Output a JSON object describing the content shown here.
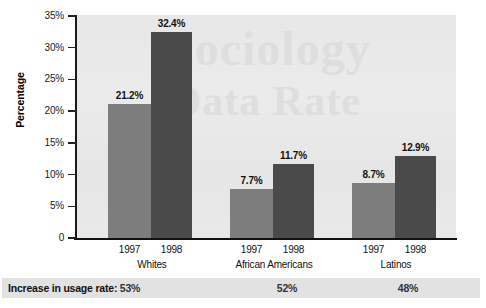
{
  "chart_data": {
    "type": "bar",
    "title": "",
    "xlabel": "",
    "ylabel": "Percentage",
    "ylim": [
      0,
      35
    ],
    "ytick_labels": [
      "0",
      "5%",
      "10%",
      "15%",
      "20%",
      "25%",
      "30%",
      "35%"
    ],
    "ytick_values": [
      0,
      5,
      10,
      15,
      20,
      25,
      30,
      35
    ],
    "grid": false,
    "legend": "none",
    "categories": [
      "Whites",
      "African Americans",
      "Latinos"
    ],
    "series": [
      {
        "name": "1997",
        "values": [
          21.2,
          7.7,
          8.7
        ],
        "labels": [
          "21.2%",
          "7.7%",
          "8.7%"
        ],
        "color": "#7d7d7d"
      },
      {
        "name": "1998",
        "values": [
          32.4,
          11.7,
          12.9
        ],
        "labels": [
          "32.4%",
          "11.7%",
          "12.9%"
        ],
        "color": "#4a4a4a"
      }
    ],
    "annotations": {
      "footer_label": "Increase in usage rate:",
      "footer_values": [
        "53%",
        "52%",
        "48%"
      ]
    },
    "watermark": {
      "line1": "Sociology",
      "line2": "Data Rate"
    }
  },
  "axis": {
    "y_title": "Percentage",
    "ticks": [
      {
        "label": "35%",
        "value": 35
      },
      {
        "label": "30%",
        "value": 30
      },
      {
        "label": "25%",
        "value": 25
      },
      {
        "label": "20%",
        "value": 20
      },
      {
        "label": "15%",
        "value": 15
      },
      {
        "label": "10%",
        "value": 10
      },
      {
        "label": "5%",
        "value": 5
      },
      {
        "label": "0",
        "value": 0
      }
    ]
  },
  "groups": [
    {
      "name": "Whites",
      "bars": [
        {
          "year": "1997",
          "label": "21.2%",
          "value": 21.2
        },
        {
          "year": "1998",
          "label": "32.4%",
          "value": 32.4
        }
      ],
      "increase": "53%"
    },
    {
      "name": "African Americans",
      "bars": [
        {
          "year": "1997",
          "label": "7.7%",
          "value": 7.7
        },
        {
          "year": "1998",
          "label": "11.7%",
          "value": 11.7
        }
      ],
      "increase": "52%"
    },
    {
      "name": "Latinos",
      "bars": [
        {
          "year": "1997",
          "label": "8.7%",
          "value": 8.7
        },
        {
          "year": "1998",
          "label": "12.9%",
          "value": 12.9
        }
      ],
      "increase": "48%"
    }
  ],
  "footer": {
    "label": "Increase in usage rate:",
    "values": [
      "53%",
      "52%",
      "48%"
    ]
  },
  "colors": {
    "bar_1997": "#7d7d7d",
    "bar_1998": "#4a4a4a",
    "plot_bg": "#e8e8e8",
    "footer_bg": "#e2e2e2",
    "axis": "#111111"
  }
}
